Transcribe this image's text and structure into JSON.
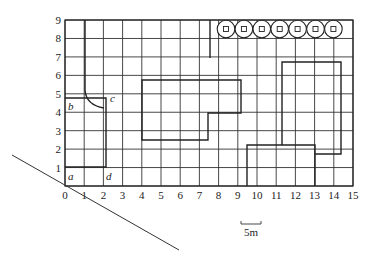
{
  "diagram": {
    "type": "site-plan-grid",
    "grid": {
      "x_ticks": [
        "0",
        "1",
        "2",
        "3",
        "4",
        "5",
        "6",
        "7",
        "8",
        "9",
        "10",
        "11",
        "12",
        "13",
        "14",
        "15"
      ],
      "y_ticks": [
        "1",
        "2",
        "3",
        "4",
        "5",
        "6",
        "7",
        "8",
        "9"
      ],
      "x_range": [
        0,
        15
      ],
      "y_range": [
        0,
        9
      ]
    },
    "points": {
      "a": "a",
      "b": "b",
      "c": "c",
      "d": "d"
    },
    "scale_bar": {
      "label": "5m"
    },
    "trees_count": 7,
    "colors": {
      "line": "#222222",
      "background": "#ffffff"
    }
  }
}
